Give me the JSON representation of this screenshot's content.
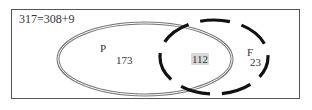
{
  "diagram": {
    "type": "venn",
    "equation": "317=308+9",
    "sets": [
      {
        "name": "P",
        "only_count": "173",
        "outline": "double-solid"
      },
      {
        "name": "F",
        "only_count": "23",
        "outline": "dashed"
      }
    ],
    "intersection_count": "112",
    "colors": {
      "frame": "#555555",
      "ellipse_p": "#666666",
      "ellipse_f": "#111111",
      "intersection_highlight": "#d9d9d9"
    }
  }
}
